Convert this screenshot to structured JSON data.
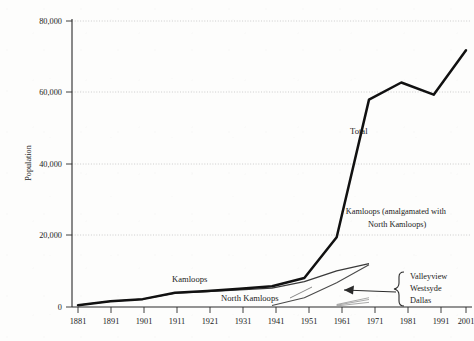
{
  "chart_data": {
    "type": "line",
    "title": "",
    "xlabel": "",
    "ylabel": "Population",
    "xlim": [
      1881,
      2001
    ],
    "ylim": [
      0,
      80000
    ],
    "grid": true,
    "grid_style": "horizontal dotted gridlines at each y tick",
    "legend": "inline series labels placed next to curves",
    "x_ticks": [
      "1881",
      "1891",
      "1901",
      "1911",
      "1921",
      "1931",
      "1941",
      "1951",
      "1961",
      "1971",
      "1981",
      "1991",
      "2001"
    ],
    "y_ticks": [
      "0",
      "20,000",
      "40,000",
      "60,000",
      "80,000"
    ],
    "x": [
      1881,
      1891,
      1901,
      1911,
      1921,
      1931,
      1941,
      1951,
      1961,
      1971,
      1981,
      1991,
      2001
    ],
    "series": [
      {
        "name": "Total",
        "label": "Total",
        "style": "thick-black",
        "values": [
          500,
          1600,
          2200,
          4000,
          4500,
          5100,
          5800,
          8100,
          19500,
          58000,
          62800,
          59400,
          71800
        ]
      },
      {
        "name": "Kamloops",
        "label": "Kamloops",
        "style": "medium-grey",
        "values": [
          500,
          1600,
          2200,
          3900,
          4300,
          4800,
          5300,
          7100,
          10100,
          12100,
          0,
          0,
          0
        ]
      },
      {
        "name": "North Kamloops",
        "label": "North Kamloops",
        "style": "thin-grey",
        "values": [
          0,
          0,
          0,
          0,
          0,
          0,
          400,
          2600,
          6800,
          11800,
          0,
          0,
          0
        ]
      },
      {
        "name": "Valleyview",
        "label": "Valleyview",
        "style": "hairline-grey",
        "values": [
          0,
          0,
          0,
          0,
          0,
          0,
          0,
          0,
          700,
          2600,
          0,
          0,
          0
        ]
      },
      {
        "name": "Westsyde",
        "label": "Westsyde",
        "style": "hairline-grey",
        "values": [
          0,
          0,
          0,
          0,
          0,
          0,
          0,
          0,
          500,
          2100,
          0,
          0,
          0
        ]
      },
      {
        "name": "Dallas",
        "label": "Dallas",
        "style": "hairline-grey",
        "values": [
          0,
          0,
          0,
          0,
          0,
          0,
          0,
          0,
          300,
          1300,
          0,
          0,
          0
        ]
      }
    ],
    "annotations": [
      {
        "id": "amalgamation-note",
        "line1": "· Kamloops (amalgamated with",
        "line2": "North Kamloops)"
      },
      {
        "id": "suburb-brace",
        "items": [
          "Valleyview",
          "Westsyde",
          "Dallas"
        ],
        "arrow": "points left toward the three hairline suburb curves"
      }
    ]
  },
  "axis": {
    "y_title": "Population",
    "y_ticks": [
      "80,000",
      "60,000",
      "40,000",
      "20,000",
      "0"
    ],
    "x_ticks": [
      "1881",
      "1891",
      "1901",
      "1911",
      "1921",
      "1931",
      "1941",
      "1951",
      "1961",
      "1971",
      "1981",
      "1991",
      "2001"
    ]
  },
  "labels": {
    "total": "Total",
    "kamloops": "Kamloops",
    "north_kamloops": "North Kamloops",
    "amalgamation_line1": "· Kamloops (amalgamated with",
    "amalgamation_line2": "North Kamloops)",
    "valleyview": "Valleyview",
    "westsyde": "Westsyde",
    "dallas": "Dallas"
  },
  "colors": {
    "background": "#fdfdfc",
    "axis": "#2a2a2a",
    "grid": "#b9b9b9",
    "total_line": "#111111",
    "kamloops_line": "#3a3a3a",
    "north_kamloops_line": "#4a4a4a",
    "suburb_line": "#8e8e8e"
  }
}
